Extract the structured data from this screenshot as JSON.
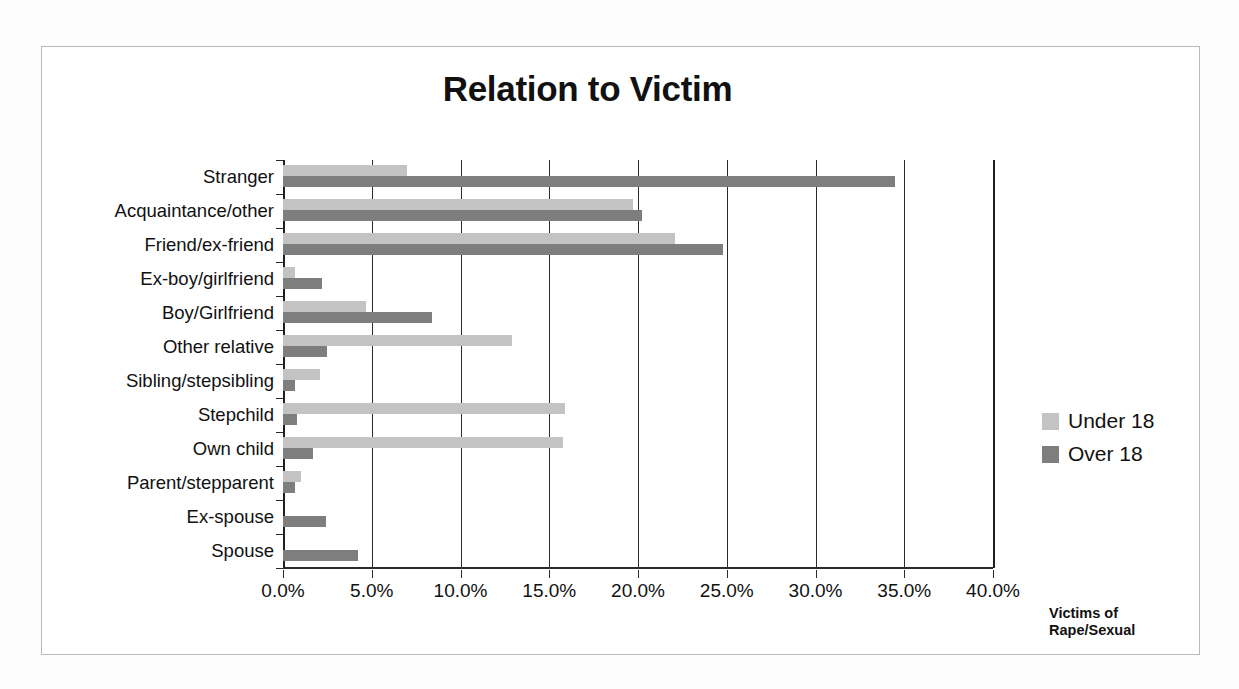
{
  "chart_data": {
    "type": "bar",
    "orientation": "horizontal",
    "title": "Relation to Victim",
    "xlabel": "",
    "ylabel": "",
    "axis_title": "Victims of Rape/Sexual",
    "axis_title_lines": [
      "Victims of",
      "Rape/Sexual"
    ],
    "xlim": [
      0,
      40
    ],
    "xtick_values": [
      0,
      5,
      10,
      15,
      20,
      25,
      30,
      35,
      40
    ],
    "xticklabels": [
      "0.0%",
      "5.0%",
      "10.0%",
      "15.0%",
      "20.0%",
      "25.0%",
      "30.0%",
      "35.0%",
      "40.0%"
    ],
    "grid": true,
    "legend_position": "right",
    "categories": [
      "Stranger",
      "Acquaintance/other",
      "Friend/ex-friend",
      "Ex-boy/girlfriend",
      "Boy/Girlfriend",
      "Other relative",
      "Sibling/stepsibling",
      "Stepchild",
      "Own child",
      "Parent/stepparent",
      "Ex-spouse",
      "Spouse"
    ],
    "series": [
      {
        "name": "Under 18",
        "color": "#c3c3c3",
        "values": [
          7.0,
          19.7,
          22.1,
          0.7,
          4.7,
          12.9,
          2.1,
          15.9,
          15.8,
          1.0,
          0.0,
          0.0
        ]
      },
      {
        "name": "Over 18",
        "color": "#7e7e7e",
        "values": [
          34.5,
          20.2,
          24.8,
          2.2,
          8.4,
          2.5,
          0.7,
          0.8,
          1.7,
          0.7,
          2.4,
          4.2
        ]
      }
    ]
  }
}
